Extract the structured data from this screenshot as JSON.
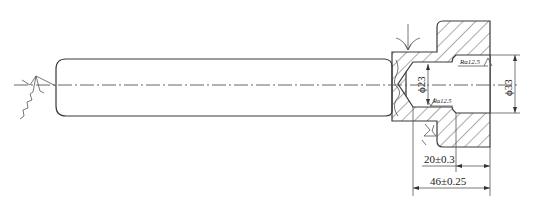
{
  "drawing": {
    "type": "mechanical technical drawing",
    "subject": "shaft with welded/pressed hub, sectioned",
    "colors": {
      "line": "#3a3a3a",
      "background": "#ffffff"
    },
    "dimensions": {
      "inner_bore_diameter": "ϕ23",
      "outer_bore_diameter": "ϕ33",
      "depth_short": "20±0.3",
      "depth_total": "46±0.25"
    },
    "surface_finish": {
      "bore_large": "Ra12.5",
      "bore_small": "Ra12.5"
    },
    "symbols": [
      "weld-symbol-left",
      "weld-arrow-top",
      "weld-symbol-bottom"
    ]
  }
}
